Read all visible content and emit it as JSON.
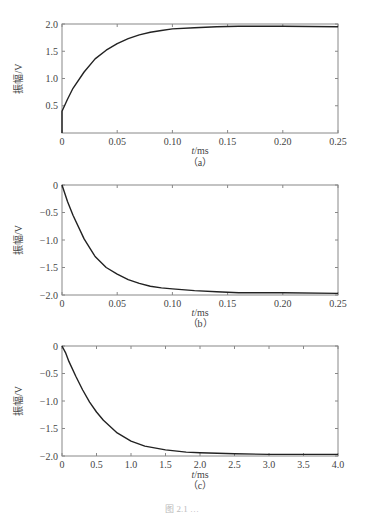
{
  "chart_data": [
    {
      "type": "line",
      "panel": "(a)",
      "title": "",
      "xlabel_italic": "t",
      "xlabel": "/ms",
      "ylabel": "振幅/V",
      "xlim": [
        0,
        0.25
      ],
      "ylim": [
        0,
        2.0
      ],
      "xticks": [
        0,
        0.05,
        0.1,
        0.15,
        0.2,
        0.25
      ],
      "xtick_labels": [
        "0",
        "0.05",
        "0.10",
        "0.15",
        "0.20",
        "0.25"
      ],
      "yticks": [
        0.5,
        1.0,
        1.5,
        2.0
      ],
      "ytick_labels": [
        "0.5",
        "1.0",
        "1.5",
        "2.0"
      ],
      "grid": false,
      "series": [
        {
          "name": "response",
          "x": [
            0,
            0,
            0.005,
            0.01,
            0.02,
            0.03,
            0.04,
            0.05,
            0.06,
            0.07,
            0.08,
            0.09,
            0.1,
            0.12,
            0.14,
            0.16,
            0.2,
            0.25
          ],
          "y": [
            0,
            0.4,
            0.62,
            0.82,
            1.12,
            1.36,
            1.52,
            1.64,
            1.73,
            1.8,
            1.85,
            1.88,
            1.91,
            1.93,
            1.95,
            1.96,
            1.96,
            1.95
          ]
        }
      ]
    },
    {
      "type": "line",
      "panel": "(b)",
      "title": "",
      "xlabel_italic": "t",
      "xlabel": "/ms",
      "ylabel": "振幅/V",
      "xlim": [
        0,
        0.25
      ],
      "ylim": [
        -2.0,
        0
      ],
      "xticks": [
        0,
        0.05,
        0.1,
        0.15,
        0.2,
        0.25
      ],
      "xtick_labels": [
        "0",
        "0.05",
        "0.10",
        "0.15",
        "0.20",
        "0.25"
      ],
      "yticks": [
        0,
        -0.5,
        -1.0,
        -1.5,
        -2.0
      ],
      "ytick_labels": [
        "0",
        "−0.5",
        "−1.0",
        "−1.5",
        "−2.0"
      ],
      "grid": false,
      "series": [
        {
          "name": "response",
          "x": [
            0,
            0.005,
            0.01,
            0.02,
            0.03,
            0.04,
            0.05,
            0.06,
            0.07,
            0.08,
            0.09,
            0.1,
            0.12,
            0.14,
            0.16,
            0.2,
            0.25
          ],
          "y": [
            0,
            -0.3,
            -0.55,
            -0.98,
            -1.3,
            -1.5,
            -1.62,
            -1.72,
            -1.79,
            -1.84,
            -1.87,
            -1.89,
            -1.92,
            -1.94,
            -1.96,
            -1.96,
            -1.97
          ]
        }
      ]
    },
    {
      "type": "line",
      "panel": "(c)",
      "title": "",
      "xlabel_italic": "t",
      "xlabel": "/ms",
      "ylabel": "振幅/V",
      "xlim": [
        0,
        4.0
      ],
      "ylim": [
        -2.0,
        0
      ],
      "xticks": [
        0,
        0.5,
        1.0,
        1.5,
        2.0,
        2.5,
        3.0,
        3.5,
        4.0
      ],
      "xtick_labels": [
        "0",
        "0.5",
        "1.0",
        "1.5",
        "2.0",
        "2.5",
        "3.0",
        "3.5",
        "4.0"
      ],
      "yticks": [
        0,
        -0.5,
        -1.0,
        -1.5,
        -2.0
      ],
      "ytick_labels": [
        "0",
        "−0.5",
        "−1.0",
        "−1.5",
        "−2.0"
      ],
      "grid": false,
      "series": [
        {
          "name": "response",
          "x": [
            0,
            0.05,
            0.1,
            0.2,
            0.3,
            0.4,
            0.5,
            0.6,
            0.8,
            1.0,
            1.2,
            1.5,
            1.8,
            2.0,
            2.5,
            3.0,
            3.5,
            4.0
          ],
          "y": [
            0,
            -0.12,
            -0.28,
            -0.55,
            -0.8,
            -1.02,
            -1.2,
            -1.35,
            -1.58,
            -1.73,
            -1.82,
            -1.89,
            -1.93,
            -1.94,
            -1.96,
            -1.97,
            -1.97,
            -1.97
          ]
        }
      ]
    }
  ],
  "caption": "图 2.1  …"
}
